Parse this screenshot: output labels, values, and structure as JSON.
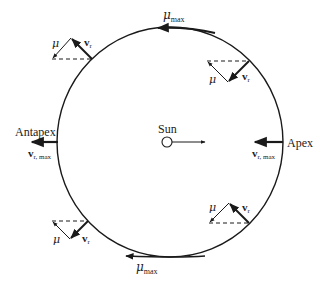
{
  "diagram": {
    "labels": {
      "sun": "Sun",
      "apex": "Apex",
      "antapex": "Antapex",
      "mu": "μ",
      "mu_max": "μ",
      "max_sub": "max",
      "v": "v",
      "r_sub": "r",
      "r_max_sub": "r, max"
    },
    "colors": {
      "stroke": "#1a1a1a",
      "background": "#ffffff"
    }
  }
}
